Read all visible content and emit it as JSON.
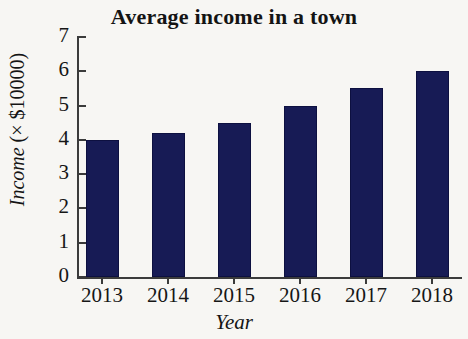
{
  "chart_data": {
    "type": "bar",
    "title": "Average income in a town",
    "xlabel": "Year",
    "ylabel": "Income (× $10000)",
    "ylabel_italic_part": "Income",
    "ylabel_upright_part": " (× $10000)",
    "categories": [
      "2013",
      "2014",
      "2015",
      "2016",
      "2017",
      "2018"
    ],
    "values": [
      4.0,
      4.2,
      4.5,
      5.0,
      5.5,
      6.0
    ],
    "series": [
      {
        "name": "Income",
        "values": [
          4.0,
          4.2,
          4.5,
          5.0,
          5.5,
          6.0
        ]
      }
    ],
    "ylim": [
      0,
      7
    ],
    "ytick_labels": [
      "0",
      "1",
      "2",
      "3",
      "4",
      "5",
      "6",
      "7"
    ],
    "ytick_values": [
      0,
      1,
      2,
      3,
      4,
      5,
      6,
      7
    ],
    "grid": false,
    "legend": false,
    "bar_color": "#17111b55",
    "colors": {
      "bar": "#171b55",
      "bar_edge": "#0d1040",
      "axis": "#3b3b3b",
      "text": "#141414",
      "background": "#f7f6f3"
    }
  }
}
